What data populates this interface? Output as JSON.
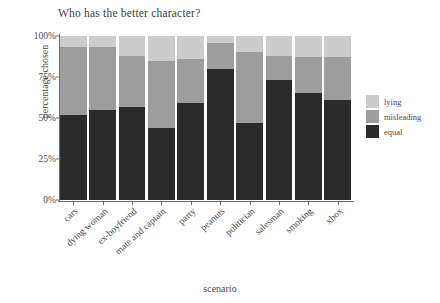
{
  "chart_data": {
    "type": "bar",
    "subtype": "stacked-percentage",
    "title": "Who has the better character?",
    "xlabel": "scenario",
    "ylabel": "percentage chosen",
    "ylim": [
      0,
      100
    ],
    "yticks": [
      "0%",
      "25%",
      "50%",
      "75%",
      "100%"
    ],
    "ytick_values": [
      0,
      25,
      50,
      75,
      100
    ],
    "grid": false,
    "legend_position": "right",
    "categories": [
      "cars",
      "dying woman",
      "ex-boyfriend",
      "mate and captain",
      "party",
      "peanuts",
      "politician",
      "salesman",
      "smoking",
      "xbox"
    ],
    "series": [
      {
        "name": "equal",
        "color": "#2b2b2b",
        "values": [
          52,
          55,
          57,
          44,
          59,
          80,
          47,
          73,
          65,
          61
        ]
      },
      {
        "name": "misleading",
        "color": "#9d9d9d",
        "values": [
          41,
          38,
          31,
          41,
          27,
          16,
          43,
          15,
          22,
          26
        ]
      },
      {
        "name": "lying",
        "color": "#cccccc",
        "values": [
          7,
          7,
          12,
          15,
          14,
          4,
          10,
          12,
          13,
          13
        ]
      }
    ],
    "legend": [
      {
        "label": "lying",
        "color": "#cccccc"
      },
      {
        "label": "misleading",
        "color": "#9d9d9d"
      },
      {
        "label": "equal",
        "color": "#2b2b2b"
      }
    ]
  }
}
